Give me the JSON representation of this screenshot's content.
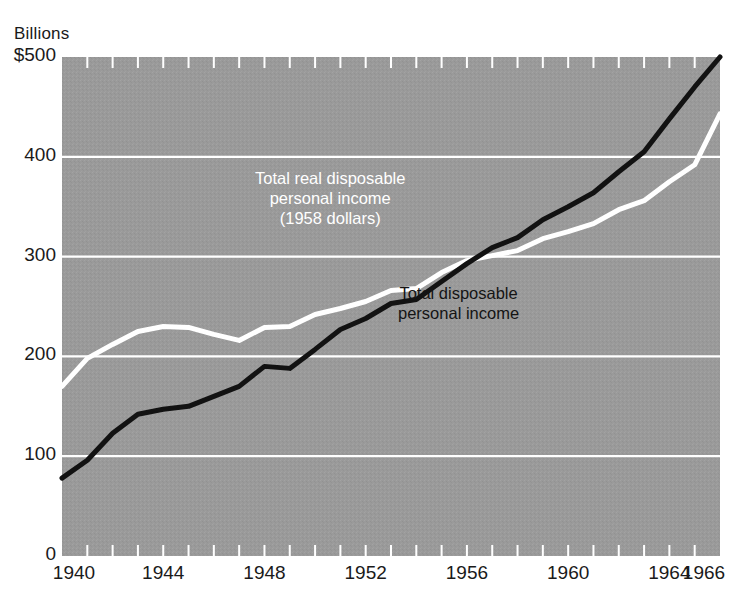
{
  "figure": {
    "units_label": "Billions",
    "background_color": "#9a9a9a",
    "page_color": "#ffffff",
    "grid_color": "#ffffff",
    "nominal_color": "#121212",
    "real_color": "#ffffff"
  },
  "annotations": {
    "real_line_1": "Total real disposable",
    "real_line_2": "personal income",
    "real_line_3": "(1958 dollars)",
    "nominal_line_1": "Total disposable",
    "nominal_line_2": "personal income"
  },
  "chart_data": {
    "type": "line",
    "title": "",
    "subtitle": "",
    "xlabel": "",
    "ylabel": "Billions",
    "xlim": [
      1940,
      1966
    ],
    "ylim": [
      0,
      500
    ],
    "grid": true,
    "legend_position": "inline-annotations",
    "y_ticks": [
      0,
      100,
      200,
      300,
      400,
      500
    ],
    "y_tick_labels": [
      "0",
      "100",
      "200",
      "300",
      "400",
      "$500"
    ],
    "x_ticks": [
      1940,
      1941,
      1942,
      1943,
      1944,
      1945,
      1946,
      1947,
      1948,
      1949,
      1950,
      1951,
      1952,
      1953,
      1954,
      1955,
      1956,
      1957,
      1958,
      1959,
      1960,
      1961,
      1962,
      1963,
      1964,
      1965,
      1966
    ],
    "x_tick_labels": [
      "1940",
      "1944",
      "1948",
      "1952",
      "1956",
      "1960",
      "1964",
      "1966"
    ],
    "x_tick_label_values": [
      1940,
      1944,
      1948,
      1952,
      1956,
      1960,
      1964,
      1966
    ],
    "x": [
      1940,
      1941,
      1942,
      1943,
      1944,
      1945,
      1946,
      1947,
      1948,
      1949,
      1950,
      1951,
      1952,
      1953,
      1954,
      1955,
      1956,
      1957,
      1958,
      1959,
      1960,
      1961,
      1962,
      1963,
      1964,
      1965,
      1966
    ],
    "series": [
      {
        "name": "Total disposable personal income",
        "color": "#121212",
        "units": "billions of current dollars",
        "values": [
          78,
          96,
          123,
          142,
          147,
          150,
          160,
          170,
          190,
          188,
          207,
          227,
          238,
          253,
          257,
          275,
          293,
          309,
          319,
          337,
          350,
          364,
          385,
          405,
          438,
          470,
          500
        ]
      },
      {
        "name": "Total real disposable personal income (1958 dollars)",
        "color": "#ffffff",
        "units": "billions of 1958 dollars",
        "values": [
          170,
          198,
          212,
          225,
          230,
          229,
          222,
          216,
          229,
          230,
          242,
          248,
          255,
          266,
          268,
          284,
          296,
          301,
          306,
          318,
          325,
          333,
          347,
          356,
          375,
          392,
          443
        ]
      }
    ]
  }
}
